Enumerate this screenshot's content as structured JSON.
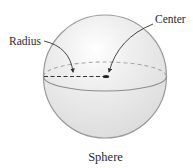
{
  "diagram": {
    "title": "Sphere",
    "labels": {
      "radius": "Radius",
      "center": "Center"
    },
    "colors": {
      "outline": "#9a9a9a",
      "fill": "#e4e4e4",
      "highlight": "#ffffff",
      "text": "#2a2a2a",
      "arrow": "#333333",
      "radius_line": "#333333",
      "back_equator": "#a8a8a8"
    }
  }
}
